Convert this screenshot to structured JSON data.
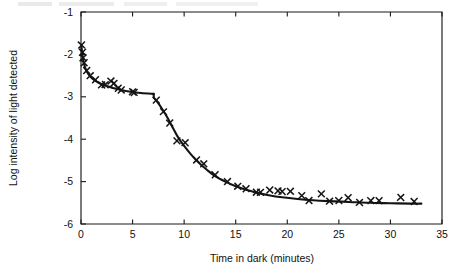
{
  "figure": {
    "background": "#ffffff",
    "ink_color": "#141414"
  },
  "chart_data": {
    "type": "scatter",
    "title": "",
    "xlabel": "Time in dark (minutes)",
    "ylabel": "Log intensity of light detected",
    "xlim": [
      0,
      35
    ],
    "ylim": [
      -6,
      -1
    ],
    "xticks": [
      0,
      5,
      10,
      15,
      20,
      25,
      30,
      35
    ],
    "xticklabels": [
      "0",
      "5",
      "10",
      "15",
      "20",
      "25",
      "30",
      "35"
    ],
    "yticks": [
      -1,
      -2,
      -3,
      -4,
      -5,
      -6
    ],
    "yticklabels": [
      "-1",
      "-2",
      "-3",
      "-4",
      "-5",
      "-6"
    ],
    "grid": false,
    "legend": null,
    "marker": "x",
    "series": [
      {
        "name": "Measured threshold",
        "marker": "x",
        "points": [
          [
            0.05,
            -1.78
          ],
          [
            0.15,
            -1.95
          ],
          [
            0.2,
            -2.08
          ],
          [
            0.3,
            -2.2
          ],
          [
            0.55,
            -2.38
          ],
          [
            0.9,
            -2.5
          ],
          [
            1.4,
            -2.6
          ],
          [
            2.0,
            -2.72
          ],
          [
            2.35,
            -2.71
          ],
          [
            2.9,
            -2.63
          ],
          [
            3.2,
            -2.68
          ],
          [
            3.6,
            -2.8
          ],
          [
            3.9,
            -2.84
          ],
          [
            5.0,
            -2.88
          ],
          [
            5.15,
            -2.9
          ],
          [
            7.3,
            -3.08
          ],
          [
            8.0,
            -3.35
          ],
          [
            8.6,
            -3.62
          ],
          [
            9.3,
            -4.04
          ],
          [
            10.1,
            -4.08
          ],
          [
            11.2,
            -4.49
          ],
          [
            11.9,
            -4.58
          ],
          [
            13.0,
            -4.84
          ],
          [
            14.2,
            -5.0
          ],
          [
            15.2,
            -5.11
          ],
          [
            16.0,
            -5.17
          ],
          [
            17.0,
            -5.25
          ],
          [
            17.4,
            -5.25
          ],
          [
            18.3,
            -5.2
          ],
          [
            19.1,
            -5.22
          ],
          [
            19.5,
            -5.23
          ],
          [
            20.3,
            -5.23
          ],
          [
            21.4,
            -5.33
          ],
          [
            22.1,
            -5.45
          ],
          [
            23.3,
            -5.29
          ],
          [
            24.1,
            -5.46
          ],
          [
            25.0,
            -5.45
          ],
          [
            25.9,
            -5.38
          ],
          [
            27.0,
            -5.49
          ],
          [
            28.1,
            -5.45
          ],
          [
            28.9,
            -5.45
          ],
          [
            31.0,
            -5.37
          ],
          [
            32.3,
            -5.47
          ]
        ]
      },
      {
        "name": "Fitted dark adaptation curve",
        "type": "line",
        "segments": [
          {
            "name": "cone-branch",
            "points": [
              [
                0.04,
                -1.8
              ],
              [
                0.12,
                -1.98
              ],
              [
                0.22,
                -2.14
              ],
              [
                0.38,
                -2.3
              ],
              [
                0.6,
                -2.42
              ],
              [
                0.9,
                -2.52
              ],
              [
                1.3,
                -2.61
              ],
              [
                1.8,
                -2.68
              ],
              [
                2.4,
                -2.74
              ],
              [
                3.1,
                -2.79
              ],
              [
                3.9,
                -2.84
              ],
              [
                4.8,
                -2.88
              ],
              [
                5.8,
                -2.91
              ],
              [
                6.9,
                -2.93
              ],
              [
                7.05,
                -2.93
              ]
            ]
          },
          {
            "name": "rod-branch",
            "points": [
              [
                7.05,
                -3.02
              ],
              [
                7.4,
                -3.12
              ],
              [
                7.9,
                -3.3
              ],
              [
                8.4,
                -3.5
              ],
              [
                8.9,
                -3.73
              ],
              [
                9.4,
                -3.95
              ],
              [
                10.0,
                -4.16
              ],
              [
                10.7,
                -4.37
              ],
              [
                11.4,
                -4.55
              ],
              [
                12.2,
                -4.72
              ],
              [
                13.0,
                -4.87
              ],
              [
                14.0,
                -5.0
              ],
              [
                15.0,
                -5.11
              ],
              [
                16.0,
                -5.19
              ],
              [
                17.0,
                -5.26
              ],
              [
                18.2,
                -5.32
              ],
              [
                19.5,
                -5.37
              ],
              [
                21.0,
                -5.41
              ],
              [
                22.5,
                -5.44
              ],
              [
                24.0,
                -5.46
              ],
              [
                26.0,
                -5.48
              ],
              [
                28.0,
                -5.5
              ],
              [
                30.0,
                -5.51
              ],
              [
                32.0,
                -5.52
              ],
              [
                33.0,
                -5.52
              ]
            ]
          }
        ]
      }
    ],
    "annotations": [
      {
        "name": "rod-cone-break",
        "x": 7.05,
        "y": -2.93,
        "label": ""
      }
    ]
  }
}
